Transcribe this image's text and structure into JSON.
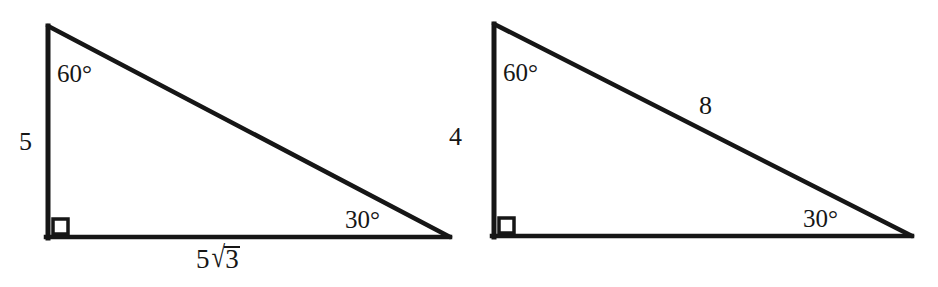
{
  "figure": {
    "background_color": "#ffffff",
    "stroke_color": "#161616",
    "triangles": [
      {
        "id": "left-triangle",
        "name": "triangle-5-5root3",
        "apex": {
          "x": 48,
          "y": 26
        },
        "right_angle_corner": {
          "x": 48,
          "y": 238
        },
        "far_corner": {
          "x": 449,
          "y": 237
        },
        "right_angle_marker": "square",
        "labels": {
          "top_angle": "60°",
          "bottom_right_angle": "30°",
          "vertical_leg": "5",
          "horizontal_leg_coefficient": "5",
          "horizontal_leg_radicand": "3",
          "horizontal_leg_full": "5√3",
          "hypotenuse": ""
        }
      },
      {
        "id": "right-triangle",
        "name": "triangle-4-8",
        "apex": {
          "x": 494,
          "y": 24
        },
        "right_angle_corner": {
          "x": 494,
          "y": 237
        },
        "far_corner": {
          "x": 911,
          "y": 236
        },
        "right_angle_marker": "square",
        "labels": {
          "top_angle": "60°",
          "bottom_right_angle": "30°",
          "vertical_leg": "4",
          "hypotenuse": "8",
          "horizontal_leg_full": ""
        }
      }
    ]
  }
}
